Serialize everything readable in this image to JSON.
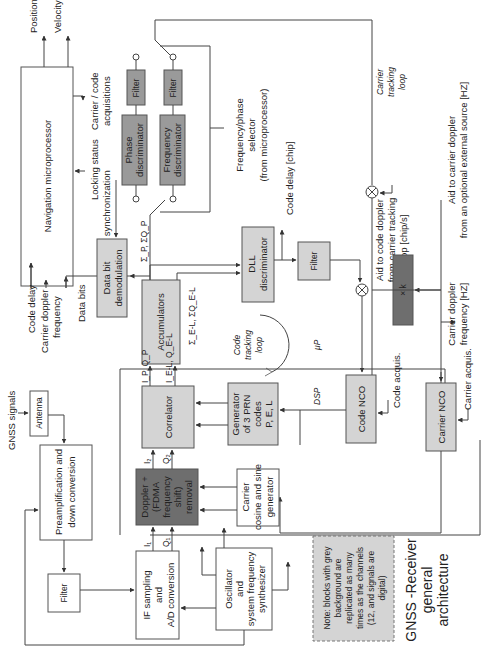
{
  "diagram": {
    "title": [
      "GNSS -Receiver",
      "general",
      "architecture"
    ],
    "note": [
      "Note: blocks with grey",
      "background are",
      "replicated as many",
      "times as the channels",
      "(12, and signals are",
      "digital)"
    ],
    "orientation": "rotated 90° counter-clockwise",
    "colors": {
      "white_block": "#ffffff",
      "light_grey_block": "#d4d4d4",
      "medium_grey_block": "#9a9a9a",
      "dark_grey_block": "#6e6e6e",
      "line": "#444444"
    },
    "blocks": {
      "nav_micro": [
        "Navigation microprocessor"
      ],
      "antenna": [
        "Antenna"
      ],
      "preamp": [
        "Preamplification and",
        "down conversion"
      ],
      "filter_rf": [
        "Filter"
      ],
      "if_sampling": [
        "IF sampling",
        "and",
        "A/D conversion"
      ],
      "oscillator": [
        "Oscillator",
        "and",
        "system frequency",
        "synthesizer"
      ],
      "doppler": [
        "Doppler +",
        "(FDMA",
        "frequency",
        "shift)",
        "removal"
      ],
      "carrier_gen": [
        "Carrier",
        "cosine and sine",
        "generator"
      ],
      "correlator": [
        "Correlator"
      ],
      "prn_gen": [
        "Generator",
        "of 3 PRN",
        "codes",
        "P, E, L"
      ],
      "accumulators": [
        "Accumulators"
      ],
      "data_bit": [
        "Data bit",
        "demodulation"
      ],
      "phase_disc": [
        "Phase",
        "discriminator"
      ],
      "freq_disc": [
        "Frequency",
        "discriminator"
      ],
      "filter_phase": [
        "Filter"
      ],
      "filter_freq": [
        "Filter"
      ],
      "dll_disc": [
        "DLL",
        "discriminator"
      ],
      "filter_dll": [
        "Filter"
      ],
      "code_nco": [
        "Code NCO"
      ],
      "carrier_nco": [
        "Carrier NCO"
      ],
      "gain_k": [
        "× k"
      ]
    },
    "labels": {
      "position": "Position",
      "velocity": "Velocity",
      "carrier_code_acq": [
        "Carrier / code",
        "acquisitions"
      ],
      "locking_status": "Locking status",
      "bit_sync": "Bit synchronization",
      "code_delay_out": "Code delay",
      "carrier_doppler_out": [
        "Carrier doppler",
        "frequency"
      ],
      "data_bits": "Data bits",
      "gnss_signals": "GNSS signals",
      "freq_phase_selector": [
        "Frequency/phase",
        "selector",
        "(from microprocessor)"
      ],
      "code_delay_chip": "Code delay [chip]",
      "carrier_tracking_loop": [
        "Carrier",
        "tracking",
        "loop"
      ],
      "aid_carrier_doppler": [
        "Aid to carrier doppler",
        "from an optional external source [HZ]"
      ],
      "aid_code_doppler": [
        "Aid to code doppler",
        "from carrier tracking",
        "loop [chip/s]"
      ],
      "carrier_doppler_hz": [
        "Carrier doppler",
        "frequency [HZ]"
      ],
      "code_tracking_loop": [
        "Code",
        "tracking",
        "loop"
      ],
      "mu_p": "μP",
      "dsp": "DSP",
      "code_acquis": "Code acquis.",
      "carrier_acquis": "Carrier acquis.",
      "sum_p": "Σ_P, ΣQ_P",
      "sum_el": "Σ_E-L, ΣQ_E-L",
      "i2": "I₂",
      "q2": "Q₂",
      "i1": "I₁",
      "q1": "Q₁",
      "ip_qp": "I_P, Q_P",
      "iel_qel": "I_E-L, Q_E-L"
    }
  }
}
